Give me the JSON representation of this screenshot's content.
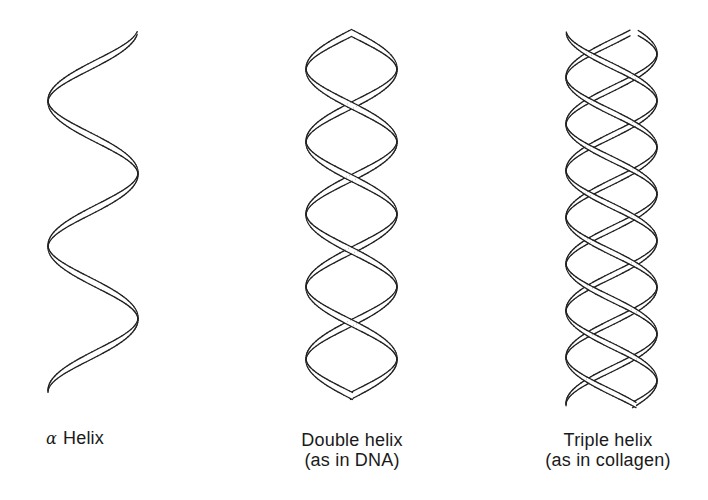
{
  "figure": {
    "background": "#ffffff",
    "stroke_color": "#1f1f1f",
    "ribbon_fill": "#ffffff"
  },
  "helices": [
    {
      "id": "alpha",
      "label_symbol": "α",
      "label_text": "Helix",
      "strands": 1,
      "x_left": 48,
      "x_right": 138,
      "y_top": 33,
      "y_bottom": 392,
      "period": 145,
      "phase": 0.28,
      "ribbon_width": 7
    },
    {
      "id": "double",
      "label_line1": "Double helix",
      "label_line2": "(as in DNA)",
      "strands": 2,
      "x_left": 306,
      "x_right": 397,
      "y_top": 33,
      "y_bottom": 396,
      "period": 145,
      "phase": 0.5,
      "ribbon_width": 7
    },
    {
      "id": "triple",
      "label_line1": "Triple helix",
      "label_line2": "(as in collagen)",
      "strands": 3,
      "x_left": 566,
      "x_right": 657,
      "y_top": 33,
      "y_bottom": 405,
      "period": 140,
      "phase": 0.1,
      "ribbon_width": 6
    }
  ],
  "labels": {
    "alpha_symbol": "α",
    "alpha_text": "Helix",
    "double_line1": "Double helix",
    "double_line2": "(as in DNA)",
    "triple_line1": "Triple helix",
    "triple_line2": "(as in collagen)"
  }
}
